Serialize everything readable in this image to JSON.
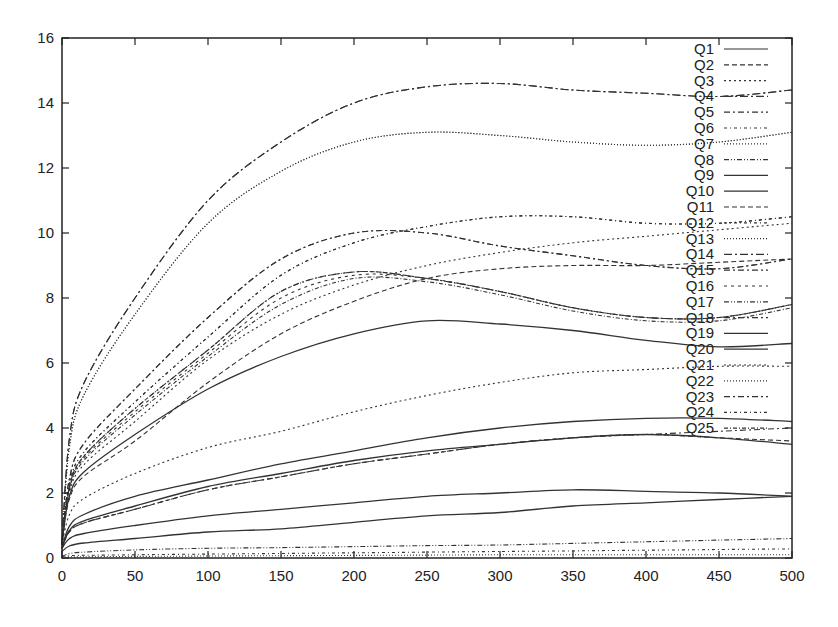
{
  "chart_data": {
    "type": "line",
    "title": "",
    "xlabel": "",
    "ylabel": "",
    "xlim": [
      0,
      500
    ],
    "ylim": [
      0,
      16
    ],
    "grid": false,
    "legend_position": "top-right inside",
    "x_ticks": [
      "0",
      "50",
      "100",
      "150",
      "200",
      "250",
      "300",
      "350",
      "400",
      "450",
      "500"
    ],
    "y_ticks": [
      "0",
      "2",
      "4",
      "6",
      "8",
      "10",
      "12",
      "14",
      "16"
    ],
    "x": [
      0,
      50,
      100,
      150,
      200,
      250,
      300,
      350,
      400,
      450,
      500
    ],
    "series": [
      {
        "name": "Q1",
        "dash": "",
        "values": [
          0.3,
          1.0,
          1.3,
          1.5,
          1.7,
          1.9,
          2.0,
          2.1,
          2.05,
          2.0,
          1.9
        ]
      },
      {
        "name": "Q2",
        "dash": "5,3",
        "values": [
          0.5,
          3.6,
          5.4,
          6.9,
          7.9,
          8.6,
          8.9,
          9.0,
          9.0,
          9.1,
          9.2
        ]
      },
      {
        "name": "Q3",
        "dash": "2,3",
        "values": [
          0.4,
          4.2,
          6.1,
          7.5,
          8.4,
          9.0,
          9.4,
          9.7,
          9.9,
          10.1,
          10.3
        ]
      },
      {
        "name": "Q4",
        "dash": "8,3,2,3",
        "values": [
          0.5,
          8.0,
          11.0,
          12.8,
          14.0,
          14.5,
          14.6,
          14.4,
          14.3,
          14.2,
          14.4
        ]
      },
      {
        "name": "Q5",
        "dash": "6,3,2,3",
        "values": [
          0.4,
          5.2,
          7.4,
          9.2,
          10.0,
          10.0,
          9.6,
          9.3,
          9.0,
          8.9,
          9.2
        ]
      },
      {
        "name": "Q6",
        "dash": "3,3,1,3",
        "values": [
          0.4,
          4.8,
          6.8,
          8.7,
          9.7,
          10.2,
          10.5,
          10.5,
          10.3,
          10.3,
          10.5
        ]
      },
      {
        "name": "Q7",
        "dash": "1,2",
        "values": [
          0.4,
          7.5,
          10.3,
          11.9,
          12.8,
          13.1,
          13.0,
          12.8,
          12.7,
          12.8,
          13.1
        ]
      },
      {
        "name": "Q8",
        "dash": "5,2,1,2,1,2",
        "values": [
          0.4,
          4.6,
          6.4,
          8.2,
          8.8,
          8.6,
          8.2,
          7.7,
          7.4,
          7.4,
          7.8
        ]
      },
      {
        "name": "Q9",
        "dash": "",
        "values": [
          0.5,
          3.8,
          5.2,
          6.2,
          6.9,
          7.3,
          7.2,
          7.0,
          6.7,
          6.5,
          6.6
        ]
      },
      {
        "name": "Q10",
        "dash": "",
        "values": [
          0.3,
          1.9,
          2.4,
          2.9,
          3.3,
          3.7,
          4.0,
          4.2,
          4.3,
          4.3,
          4.2
        ]
      },
      {
        "name": "Q11",
        "dash": "5,3",
        "values": [
          0.3,
          1.5,
          2.1,
          2.5,
          2.9,
          3.2,
          3.5,
          3.7,
          3.8,
          3.7,
          3.6
        ]
      },
      {
        "name": "Q12",
        "dash": "3,3,1,3",
        "values": [
          0.4,
          4.8,
          6.8,
          8.7,
          9.7,
          10.2,
          10.5,
          10.5,
          10.3,
          10.3,
          10.5
        ]
      },
      {
        "name": "Q13",
        "dash": "1,2",
        "values": [
          0.4,
          7.5,
          10.3,
          11.9,
          12.8,
          13.1,
          13.0,
          12.8,
          12.7,
          12.8,
          13.1
        ]
      },
      {
        "name": "Q14",
        "dash": "8,3,2,3",
        "values": [
          0.5,
          8.0,
          11.0,
          12.8,
          14.0,
          14.5,
          14.6,
          14.4,
          14.3,
          14.2,
          14.4
        ]
      },
      {
        "name": "Q15",
        "dash": "6,3,2,3",
        "values": [
          0.4,
          5.2,
          7.4,
          9.2,
          10.0,
          10.0,
          9.6,
          9.3,
          9.0,
          8.9,
          9.2
        ]
      },
      {
        "name": "Q16",
        "dash": "3,4",
        "values": [
          0.4,
          4.5,
          6.3,
          8.0,
          8.7,
          8.6,
          8.2,
          7.7,
          7.4,
          7.4,
          7.8
        ]
      },
      {
        "name": "Q17",
        "dash": "5,2,1,2,1,2",
        "values": [
          0.05,
          0.25,
          0.3,
          0.32,
          0.35,
          0.38,
          0.4,
          0.45,
          0.5,
          0.55,
          0.6
        ]
      },
      {
        "name": "Q18",
        "dash": "6,3,2,3",
        "values": [
          0.4,
          4.6,
          6.4,
          8.2,
          8.8,
          8.6,
          8.2,
          7.7,
          7.4,
          7.4,
          7.8
        ]
      },
      {
        "name": "Q19",
        "dash": "",
        "values": [
          0.2,
          0.6,
          0.8,
          0.9,
          1.1,
          1.3,
          1.4,
          1.6,
          1.7,
          1.8,
          1.9
        ]
      },
      {
        "name": "Q20",
        "dash": "",
        "values": [
          0.3,
          1.6,
          2.2,
          2.6,
          3.0,
          3.3,
          3.5,
          3.7,
          3.8,
          3.7,
          3.5
        ]
      },
      {
        "name": "Q21",
        "dash": "2,3",
        "values": [
          0.4,
          2.6,
          3.4,
          3.9,
          4.5,
          5.0,
          5.4,
          5.7,
          5.8,
          5.9,
          5.9
        ]
      },
      {
        "name": "Q22",
        "dash": "1,2",
        "values": [
          0.02,
          0.05,
          0.06,
          0.07,
          0.08,
          0.09,
          0.1,
          0.1,
          0.1,
          0.1,
          0.1
        ]
      },
      {
        "name": "Q23",
        "dash": "6,3,2,3",
        "values": [
          0.3,
          1.5,
          2.1,
          2.5,
          2.9,
          3.2,
          3.5,
          3.7,
          3.8,
          3.9,
          4.0
        ]
      },
      {
        "name": "Q24",
        "dash": "3,3,1,3",
        "values": [
          0.05,
          0.1,
          0.12,
          0.14,
          0.16,
          0.18,
          0.2,
          0.22,
          0.24,
          0.26,
          0.28
        ]
      },
      {
        "name": "Q25",
        "dash": "4,2,1,2",
        "values": [
          0.4,
          4.4,
          6.2,
          7.8,
          8.6,
          8.5,
          8.1,
          7.6,
          7.3,
          7.3,
          7.7
        ]
      }
    ]
  },
  "colors": {
    "axis": "#222222",
    "line": "#333333",
    "background": "#ffffff"
  }
}
